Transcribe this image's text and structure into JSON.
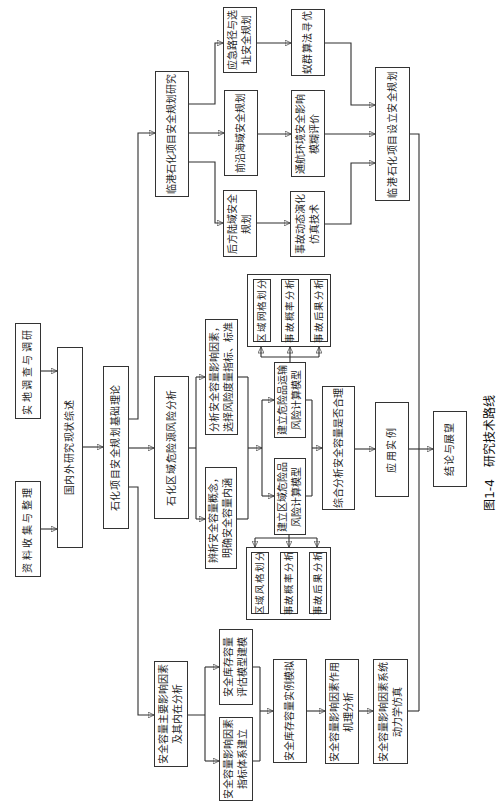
{
  "figure": {
    "number": "图1-4",
    "title": "研究技术路线"
  },
  "inputs": {
    "field_survey": "实地调查与调研",
    "data_collection": "资料收集与整理"
  },
  "literature_review": "国内外研究现状综述",
  "basic_theory": "石化项目安全规划基础理论",
  "port_branch": {
    "title": "临港石化项目安全规划研究",
    "subtopics": [
      {
        "label": [
          "应急路径与选",
          "址安全规划"
        ],
        "method": [
          "蚁群算法寻优"
        ]
      },
      {
        "label": [
          "前沿海域安全规划"
        ],
        "method": [
          "通航环境安全影响",
          "模糊评价"
        ]
      },
      {
        "label": [
          "后方陆域安全",
          "规划"
        ],
        "method": [
          "事故动态演化",
          "仿真技术"
        ]
      }
    ],
    "result": "临港石化项目设立安全规划"
  },
  "hazard_branch": {
    "title": "石化区域危险源风险分析",
    "analysis": [
      {
        "lines": [
          "分析安全容量影响因素，",
          "选择风险度量指标、标准"
        ]
      },
      {
        "lines": [
          "辨析安全容量概念，",
          "明确安全容量内涵"
        ]
      }
    ],
    "models": [
      {
        "lines": [
          "建立危险品运输",
          "风险计算模型"
        ],
        "substeps": [
          "区域网格划分",
          "事故概率分析",
          "事故后果分析"
        ]
      },
      {
        "lines": [
          "建立区域危险品",
          "风险计算模型"
        ],
        "substeps": [
          "区域风格划分",
          "事故概率分析",
          "事故后果分析"
        ]
      }
    ],
    "synthesis": "综合分析安全容量是否合理"
  },
  "capacity_branch": {
    "title": [
      "安全容量主要影响因素",
      "及其内在分析"
    ],
    "parallel": [
      {
        "lines": [
          "安全库存容量",
          "评估模型建模"
        ]
      },
      {
        "lines": [
          "安全容量影响因素",
          "指标体系建立"
        ]
      }
    ],
    "steps": [
      {
        "lines": [
          "安全库存容量实例模拟"
        ]
      },
      {
        "lines": [
          "安全容量影响因素作用",
          "机理分析"
        ]
      },
      {
        "lines": [
          "安全容量影响因素系统",
          "动力学仿真"
        ]
      }
    ]
  },
  "application": "应用实例",
  "conclusion": "结论与展望",
  "colors": {
    "line": "#2e2e2e",
    "border": "#333333",
    "text": "#1c1c1c",
    "background": "#ffffff"
  }
}
